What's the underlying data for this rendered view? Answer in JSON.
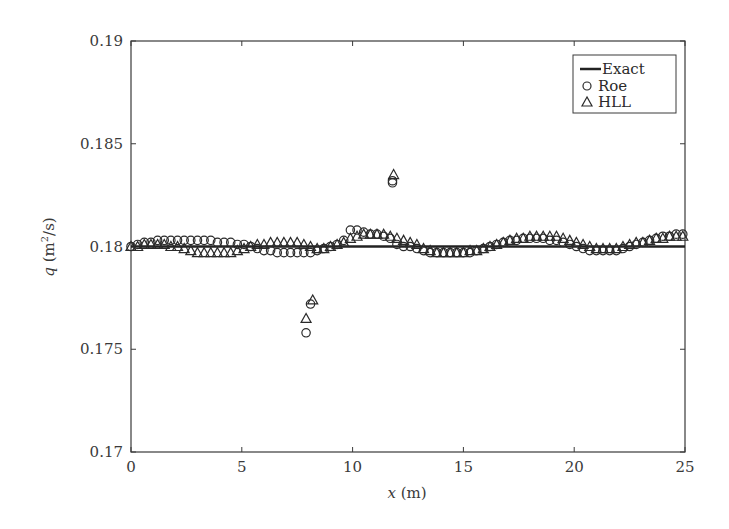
{
  "chart_data": {
    "type": "scatter",
    "title": "",
    "xlabel_var": "x",
    "xlabel_unit": " (m)",
    "ylabel_var": "q",
    "ylabel_unit_pre": " (m",
    "ylabel_unit_sup": "2",
    "ylabel_unit_post": "/s)",
    "xlim": [
      0,
      25
    ],
    "ylim": [
      0.17,
      0.19
    ],
    "xticks": [
      0,
      5,
      10,
      15,
      20,
      25
    ],
    "xtick_labels": [
      "0",
      "5",
      "10",
      "15",
      "20",
      "25"
    ],
    "yticks": [
      0.17,
      0.175,
      0.18,
      0.185,
      0.19
    ],
    "ytick_labels": [
      "0.17",
      "0.175",
      "0.18",
      "0.185",
      "0.19"
    ],
    "grid": false,
    "legend": {
      "position": "top-right",
      "entries": [
        {
          "label": "Exact",
          "marker": "line"
        },
        {
          "label": "Roe",
          "marker": "circle"
        },
        {
          "label": "HLL",
          "marker": "triangle"
        }
      ]
    },
    "series": [
      {
        "name": "Exact",
        "style": "line",
        "x": [
          0,
          25
        ],
        "y": [
          0.18,
          0.18
        ]
      },
      {
        "name": "Roe",
        "style": "circle",
        "x": [
          0,
          0.3,
          0.6,
          0.9,
          1.2,
          1.5,
          1.8,
          2.1,
          2.4,
          2.7,
          3.0,
          3.3,
          3.6,
          3.9,
          4.2,
          4.5,
          4.8,
          5.1,
          5.4,
          5.7,
          6.0,
          6.3,
          6.6,
          6.9,
          7.2,
          7.5,
          7.8,
          8.1,
          8.4,
          8.7,
          9.0,
          9.3,
          9.6,
          9.9,
          10.2,
          10.5,
          10.8,
          11.1,
          11.4,
          11.7,
          12.0,
          12.3,
          12.6,
          12.9,
          13.2,
          13.5,
          13.8,
          14.1,
          14.4,
          14.7,
          15.0,
          15.3,
          15.6,
          15.9,
          16.2,
          16.5,
          16.8,
          17.1,
          17.4,
          17.7,
          18.0,
          18.3,
          18.6,
          18.9,
          19.2,
          19.5,
          19.8,
          20.1,
          20.4,
          20.7,
          21.0,
          21.3,
          21.6,
          21.9,
          22.2,
          22.5,
          22.8,
          23.1,
          23.4,
          23.7,
          24.0,
          24.3,
          24.6,
          24.9,
          8.1,
          7.9,
          11.8,
          11.8
        ],
        "y": [
          0.18,
          0.1801,
          0.1802,
          0.1802,
          0.1803,
          0.1803,
          0.1803,
          0.1803,
          0.1803,
          0.1803,
          0.1803,
          0.1803,
          0.1803,
          0.1802,
          0.1802,
          0.1802,
          0.1801,
          0.1801,
          0.18,
          0.1799,
          0.1798,
          0.1798,
          0.1797,
          0.1797,
          0.1797,
          0.1797,
          0.1797,
          0.1797,
          0.1798,
          0.1799,
          0.18,
          0.1801,
          0.1803,
          0.1808,
          0.1808,
          0.1807,
          0.1806,
          0.1806,
          0.1805,
          0.1804,
          0.1801,
          0.18,
          0.18,
          0.1799,
          0.1798,
          0.1797,
          0.1797,
          0.1797,
          0.1797,
          0.1797,
          0.1797,
          0.1797,
          0.1798,
          0.1799,
          0.18,
          0.1801,
          0.1802,
          0.1803,
          0.1803,
          0.1804,
          0.1804,
          0.1804,
          0.1804,
          0.1803,
          0.1803,
          0.1802,
          0.1801,
          0.18,
          0.1799,
          0.1798,
          0.1798,
          0.1798,
          0.1798,
          0.1798,
          0.1799,
          0.18,
          0.1801,
          0.1802,
          0.1803,
          0.1804,
          0.1805,
          0.1805,
          0.1806,
          0.1806,
          0.1772,
          0.1758,
          0.1831,
          0.1832
        ]
      },
      {
        "name": "HLL",
        "style": "triangle",
        "x": [
          0,
          0.3,
          0.6,
          0.9,
          1.2,
          1.5,
          1.8,
          2.1,
          2.4,
          2.7,
          3.0,
          3.3,
          3.6,
          3.9,
          4.2,
          4.5,
          4.8,
          5.1,
          5.4,
          5.7,
          6.0,
          6.3,
          6.6,
          6.9,
          7.2,
          7.5,
          7.8,
          8.1,
          8.4,
          8.7,
          9.0,
          9.3,
          9.6,
          9.9,
          10.2,
          10.5,
          10.8,
          11.1,
          11.4,
          11.7,
          12.0,
          12.3,
          12.6,
          12.9,
          13.2,
          13.5,
          13.8,
          14.1,
          14.4,
          14.7,
          15.0,
          15.3,
          15.6,
          15.9,
          16.2,
          16.5,
          16.8,
          17.1,
          17.4,
          17.7,
          18.0,
          18.3,
          18.6,
          18.9,
          19.2,
          19.5,
          19.8,
          20.1,
          20.4,
          20.7,
          21.0,
          21.3,
          21.6,
          21.9,
          22.2,
          22.5,
          22.8,
          23.1,
          23.4,
          23.7,
          24.0,
          24.3,
          24.6,
          24.9,
          8.2,
          7.9,
          11.85
        ],
        "y": [
          0.18,
          0.18,
          0.1801,
          0.1801,
          0.1801,
          0.1801,
          0.18,
          0.18,
          0.1799,
          0.1798,
          0.1797,
          0.1797,
          0.1797,
          0.1797,
          0.1797,
          0.1797,
          0.1798,
          0.1799,
          0.18,
          0.1801,
          0.1801,
          0.1802,
          0.1802,
          0.1802,
          0.1802,
          0.1802,
          0.1801,
          0.18,
          0.1799,
          0.1799,
          0.18,
          0.1801,
          0.1802,
          0.1804,
          0.1805,
          0.1806,
          0.1806,
          0.1806,
          0.1806,
          0.1805,
          0.1804,
          0.1803,
          0.1802,
          0.1801,
          0.1799,
          0.1798,
          0.1797,
          0.1797,
          0.1797,
          0.1797,
          0.1797,
          0.1798,
          0.1798,
          0.1799,
          0.18,
          0.1801,
          0.1802,
          0.1803,
          0.1804,
          0.1804,
          0.1805,
          0.1805,
          0.1805,
          0.1805,
          0.1805,
          0.1804,
          0.1803,
          0.1802,
          0.1801,
          0.18,
          0.1799,
          0.1799,
          0.1799,
          0.1799,
          0.18,
          0.1801,
          0.1802,
          0.1802,
          0.1803,
          0.1804,
          0.1804,
          0.1805,
          0.1805,
          0.1805,
          0.1774,
          0.1765,
          0.1835
        ]
      }
    ]
  },
  "colors": {
    "axis": "#3a3a3a",
    "marker": "#2a2a2a",
    "exact_line": "#222222"
  }
}
